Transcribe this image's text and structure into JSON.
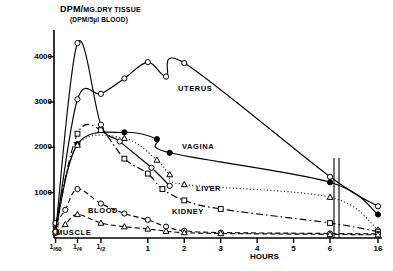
{
  "chart_data": {
    "type": "line",
    "title": "DPM/MG.DRY TISSUE",
    "title_main": "DPM/",
    "title_sub_inline": "MG.DRY TISSUE",
    "subtitle": "(DPM/5µl BLOOD)",
    "xlabel": "HOURS",
    "ylabel": "DPM/MG.DRY TISSUE (DPM/5µl BLOOD)",
    "ylim": [
      0,
      4500
    ],
    "yticks": [
      1000,
      2000,
      3000,
      4000
    ],
    "ytick_labels": [
      "1000",
      "2000",
      "3000",
      "4000"
    ],
    "xticks": [
      0.0167,
      0.25,
      0.5,
      1,
      2,
      3,
      4,
      5,
      6,
      16
    ],
    "xtick_labels": [
      "1/60",
      "1/4",
      "1/2",
      "1",
      "2",
      "3",
      "4",
      "5",
      "6",
      "16"
    ],
    "axis_break": {
      "between": [
        6,
        16
      ],
      "style": "double-vertical-line"
    },
    "grid": false,
    "legend_position": "inline-curve-labels",
    "series": [
      {
        "name": "UTERUS",
        "marker": "open-circle",
        "line_style": "solid",
        "color": "#000000",
        "points": [
          {
            "x": 0.0167,
            "y": 120
          },
          {
            "x": 0.25,
            "y": 3060
          },
          {
            "x": 0.5,
            "y": 3180
          },
          {
            "x": 0.75,
            "y": 3520
          },
          {
            "x": 1.0,
            "y": 3880
          },
          {
            "x": 1.5,
            "y": 3560
          },
          {
            "x": 2.0,
            "y": 3860
          },
          {
            "x": 6.0,
            "y": 1350
          },
          {
            "x": 16.0,
            "y": 700
          }
        ]
      },
      {
        "name": "VAGINA",
        "marker": "filled-circle",
        "line_style": "solid",
        "color": "#000000",
        "points": [
          {
            "x": 0.0167,
            "y": 150
          },
          {
            "x": 0.25,
            "y": 2070
          },
          {
            "x": 0.75,
            "y": 2330
          },
          {
            "x": 1.25,
            "y": 2180
          },
          {
            "x": 1.6,
            "y": 1880
          },
          {
            "x": 6.0,
            "y": 1230
          },
          {
            "x": 16.0,
            "y": 520
          }
        ]
      },
      {
        "name": "LIVER",
        "marker": "open-triangle",
        "line_style": "dotted",
        "color": "#000000",
        "points": [
          {
            "x": 0.0167,
            "y": 180
          },
          {
            "x": 0.25,
            "y": 2050
          },
          {
            "x": 0.75,
            "y": 2200
          },
          {
            "x": 1.25,
            "y": 1720
          },
          {
            "x": 1.6,
            "y": 1400
          },
          {
            "x": 2.0,
            "y": 1180
          },
          {
            "x": 6.0,
            "y": 900
          },
          {
            "x": 16.0,
            "y": 180
          }
        ]
      },
      {
        "name": "KIDNEY",
        "marker": "open-square",
        "line_style": "dash-dot",
        "color": "#000000",
        "points": [
          {
            "x": 0.0167,
            "y": 300
          },
          {
            "x": 0.25,
            "y": 2300
          },
          {
            "x": 0.5,
            "y": 2380
          },
          {
            "x": 0.75,
            "y": 1750
          },
          {
            "x": 1.0,
            "y": 1420
          },
          {
            "x": 1.4,
            "y": 1080
          },
          {
            "x": 2.0,
            "y": 830
          },
          {
            "x": 3.0,
            "y": 640
          },
          {
            "x": 6.0,
            "y": 330
          },
          {
            "x": 16.0,
            "y": 140
          }
        ]
      },
      {
        "name": "BLOOD",
        "marker": "open-circle",
        "line_style": "dashed",
        "color": "#000000",
        "points": [
          {
            "x": 0.0167,
            "y": 330
          },
          {
            "x": 0.12,
            "y": 620
          },
          {
            "x": 0.25,
            "y": 1080
          },
          {
            "x": 0.5,
            "y": 760
          },
          {
            "x": 0.75,
            "y": 540
          },
          {
            "x": 1.0,
            "y": 400
          },
          {
            "x": 1.5,
            "y": 250
          },
          {
            "x": 2.0,
            "y": 160
          },
          {
            "x": 3.0,
            "y": 120
          },
          {
            "x": 6.0,
            "y": 100
          },
          {
            "x": 16.0,
            "y": 90
          }
        ]
      },
      {
        "name": "MUSCLE",
        "marker": "open-triangle",
        "line_style": "dashed",
        "color": "#000000",
        "points": [
          {
            "x": 0.0167,
            "y": 120
          },
          {
            "x": 0.12,
            "y": 300
          },
          {
            "x": 0.25,
            "y": 520
          },
          {
            "x": 0.5,
            "y": 330
          },
          {
            "x": 0.75,
            "y": 250
          },
          {
            "x": 1.0,
            "y": 200
          },
          {
            "x": 1.5,
            "y": 150
          },
          {
            "x": 2.0,
            "y": 120
          },
          {
            "x": 3.0,
            "y": 100
          },
          {
            "x": 6.0,
            "y": 80
          },
          {
            "x": 16.0,
            "y": 70
          }
        ]
      },
      {
        "name": "PEAK-SPIKE",
        "marker": "open-circle",
        "line_style": "solid",
        "color": "#000000",
        "points": [
          {
            "x": 0.0167,
            "y": 140
          },
          {
            "x": 0.25,
            "y": 4300
          },
          {
            "x": 0.5,
            "y": 2500
          },
          {
            "x": 0.7,
            "y": 2130
          },
          {
            "x": 1.1,
            "y": 1550
          },
          {
            "x": 1.6,
            "y": 1150
          }
        ]
      }
    ],
    "curve_labels": [
      {
        "text": "UTERUS",
        "x": 178,
        "y": 84
      },
      {
        "text": "VAGINA",
        "x": 182,
        "y": 142
      },
      {
        "text": "LIVER",
        "x": 196,
        "y": 184
      },
      {
        "text": "KIDNEY",
        "x": 172,
        "y": 207
      },
      {
        "text": "BLOOD",
        "x": 88,
        "y": 206
      },
      {
        "text": "MUSCLE",
        "x": 56,
        "y": 228
      }
    ]
  }
}
